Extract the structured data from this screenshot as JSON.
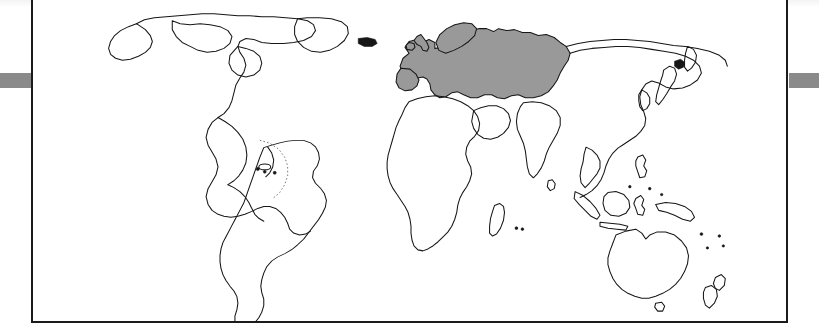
{
  "figure": {
    "kind": "world-map-figure",
    "caption": "",
    "frame": {
      "border_color": "#1b1b1b",
      "background_color": "#ffffff",
      "x": 31,
      "y": -3,
      "width": 757,
      "height": 326
    }
  },
  "scan_artifacts": {
    "edge_bar_color": "#8a8a8a",
    "edge_bar_label_left": "page-edge-shadow-left",
    "edge_bar_label_right": "page-edge-shadow-right",
    "top_strip_color": "#f4f3f1"
  },
  "map": {
    "projection": "equirectangular",
    "coastline_color": "#161616",
    "ocean_color": "#ffffff",
    "highlight_color": "#999999",
    "highlight_region_name": "Europe and Western Russia",
    "highlighted_landmasses": [
      "Europe",
      "Scandinavia",
      "British Isles",
      "Iberian Peninsula",
      "Western Russia"
    ],
    "unhighlighted_landmasses": [
      "North America",
      "Greenland",
      "South America",
      "Africa",
      "Middle East",
      "South Asia",
      "East Asia",
      "Southeast Asia",
      "Australia",
      "New Zealand"
    ]
  }
}
